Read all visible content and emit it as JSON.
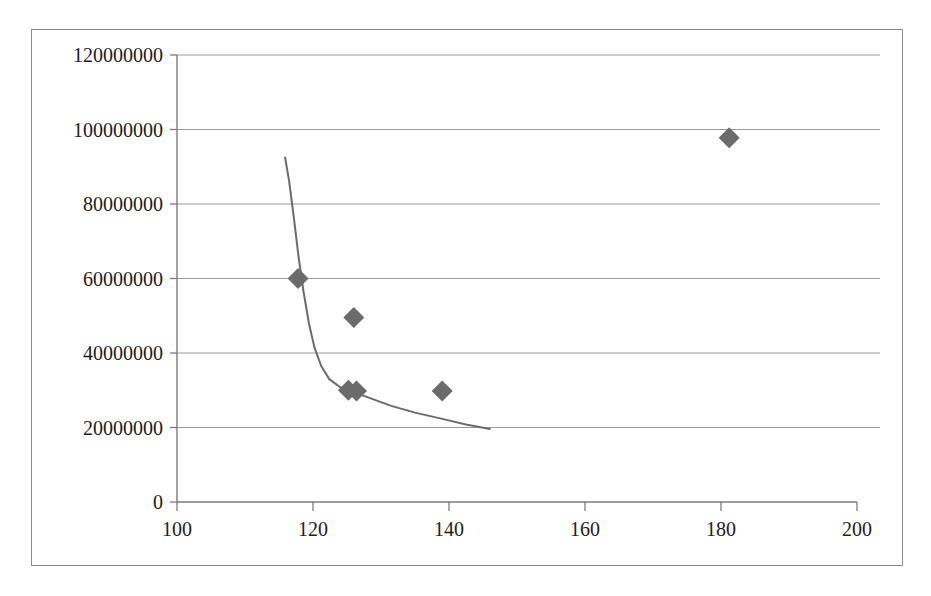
{
  "chart_data": {
    "type": "scatter",
    "title": "",
    "xlabel": "",
    "ylabel": "",
    "xlim": [
      100,
      200
    ],
    "ylim": [
      0,
      120000000
    ],
    "grid": "horizontal",
    "legend": "none",
    "x_ticks": [
      100,
      120,
      140,
      160,
      180,
      200
    ],
    "x_tick_labels": [
      "100",
      "120",
      "140",
      "160",
      "180",
      "200"
    ],
    "y_ticks": [
      0,
      20000000,
      40000000,
      60000000,
      80000000,
      100000000,
      120000000
    ],
    "y_tick_labels": [
      "0",
      "20000000",
      "40000000",
      "60000000",
      "80000000",
      "100000000",
      "120000000"
    ],
    "series": [
      {
        "name": "data-points",
        "type": "scatter",
        "marker": "diamond",
        "color": "#6b6b6b",
        "points": [
          {
            "x": 117.8,
            "y": 60000000
          },
          {
            "x": 126.0,
            "y": 49500000
          },
          {
            "x": 125.2,
            "y": 30000000
          },
          {
            "x": 126.4,
            "y": 29800000
          },
          {
            "x": 139.0,
            "y": 29800000
          },
          {
            "x": 181.2,
            "y": 97800000
          }
        ]
      },
      {
        "name": "fitted-curve",
        "type": "line",
        "color": "#6b6b6b",
        "points": [
          {
            "x": 115.9,
            "y": 92500000
          },
          {
            "x": 116.5,
            "y": 86000000
          },
          {
            "x": 117.2,
            "y": 76000000
          },
          {
            "x": 117.9,
            "y": 65500000
          },
          {
            "x": 118.6,
            "y": 56500000
          },
          {
            "x": 119.4,
            "y": 48000000
          },
          {
            "x": 120.2,
            "y": 41500000
          },
          {
            "x": 121.2,
            "y": 36500000
          },
          {
            "x": 122.4,
            "y": 33000000
          },
          {
            "x": 124.0,
            "y": 30800000
          },
          {
            "x": 126.0,
            "y": 29500000
          },
          {
            "x": 128.5,
            "y": 27800000
          },
          {
            "x": 131.5,
            "y": 25800000
          },
          {
            "x": 135.0,
            "y": 24000000
          },
          {
            "x": 139.0,
            "y": 22300000
          },
          {
            "x": 142.5,
            "y": 20800000
          },
          {
            "x": 146.0,
            "y": 19600000
          }
        ]
      }
    ]
  },
  "colors": {
    "frame": "#8d8d8d",
    "axis": "#7a7a7a",
    "gridline": "#9a9a9a",
    "marker": "#6b6b6b",
    "curve": "#6b6b6b",
    "tick_text": "#1c1c1c"
  }
}
